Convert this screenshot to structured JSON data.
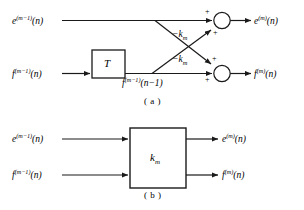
{
  "figure": {
    "title_caption_a": "( a )",
    "title_caption_b": "( b )",
    "stroke_color": "#1a1a1a",
    "background_color": "#ffffff",
    "panel_a": {
      "inputs": [
        {
          "name": "e-input",
          "base": "e",
          "superscript": "(m−1)",
          "argument": "(n)"
        },
        {
          "name": "f-input",
          "base": "f",
          "superscript": "(m−1)",
          "argument": "(n)"
        }
      ],
      "outputs": [
        {
          "name": "e-output",
          "base": "e",
          "superscript": "(m)",
          "argument": "(n)"
        },
        {
          "name": "f-output",
          "base": "f",
          "superscript": "(m)",
          "argument": "(n)"
        }
      ],
      "delay_block_label": "T",
      "delayed_signal": {
        "base": "f",
        "superscript": "(m−1)",
        "argument": "(n−1)"
      },
      "gain_labels": [
        "−k",
        "−k"
      ],
      "gain_subscript": "m",
      "adder_signs": [
        "+",
        "+",
        "+",
        "+"
      ]
    },
    "panel_b": {
      "inputs": [
        {
          "name": "e-input",
          "base": "e",
          "superscript": "(m−1)",
          "argument": "(n)"
        },
        {
          "name": "f-input",
          "base": "f",
          "superscript": "(m−1)",
          "argument": "(n)"
        }
      ],
      "outputs": [
        {
          "name": "e-output",
          "base": "e",
          "superscript": "(m)",
          "argument": "(n)"
        },
        {
          "name": "f-output",
          "base": "f",
          "superscript": "(m)",
          "argument": "(n)"
        }
      ],
      "block_label": "k",
      "block_label_subscript": "m"
    }
  }
}
